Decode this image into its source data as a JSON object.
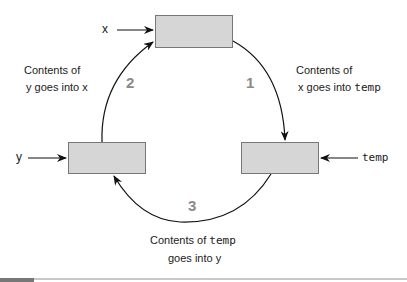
{
  "diagram": {
    "boxes": [
      {
        "id": "x",
        "label": "x"
      },
      {
        "id": "temp",
        "label": "temp"
      },
      {
        "id": "y",
        "label": "y"
      }
    ],
    "steps": [
      {
        "number": "2",
        "line1": "Contents of",
        "line2_var": "y",
        "line2_mid": " goes into ",
        "line2_target": "x"
      },
      {
        "number": "1",
        "line1": "Contents of",
        "line2_var": "x",
        "line2_mid": " goes into ",
        "line2_target": "temp"
      },
      {
        "number": "3",
        "line1_text": "Contents of ",
        "line1_var": "temp",
        "line2_text": "goes into ",
        "line2_target": "y"
      }
    ],
    "colors": {
      "box_fill": "#d6d6d6",
      "box_border": "#777777",
      "step_number": "#8a8a8a"
    }
  }
}
